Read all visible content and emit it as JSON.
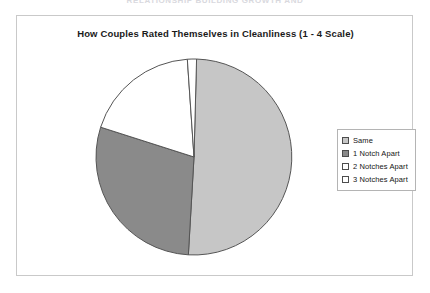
{
  "page": {
    "top_caption": "RELATIONSHIP BUILDING GROWTH AND"
  },
  "chart_frame": {
    "border_color": "#c9c9c9",
    "background": "#ffffff"
  },
  "legend": {
    "position": "right",
    "border_color": "#b4b4b4",
    "items": [
      {
        "label": "Same",
        "color": "#c6c6c6",
        "swatch": "legend-swatch-same"
      },
      {
        "label": "1 Notch Apart",
        "color": "#8a8a8a",
        "swatch": "legend-swatch-1-notch"
      },
      {
        "label": "2 Notches Apart",
        "color": "#ffffff",
        "swatch": "legend-swatch-2-notches"
      },
      {
        "label": "3 Notches Apart",
        "color": "#ffffff",
        "swatch": "legend-swatch-3-notches"
      }
    ]
  },
  "chart_data": {
    "type": "pie",
    "title": "How Couples Rated Themselves in Cleanliness (1 - 4 Scale)",
    "xlabel": "",
    "ylabel": "",
    "categories": [
      "Same",
      "1 Notch Apart",
      "2 Notches Apart",
      "3 Notches Apart"
    ],
    "values": [
      50.5,
      29.0,
      19.0,
      1.5
    ],
    "units": "percent",
    "colors": [
      "#c6c6c6",
      "#8a8a8a",
      "#ffffff",
      "#ffffff"
    ],
    "slice_border_color": "#555555",
    "start_angle_deg": 1.5,
    "direction": "clockwise",
    "legend_position": "right",
    "grid": false,
    "data_labels": false
  }
}
